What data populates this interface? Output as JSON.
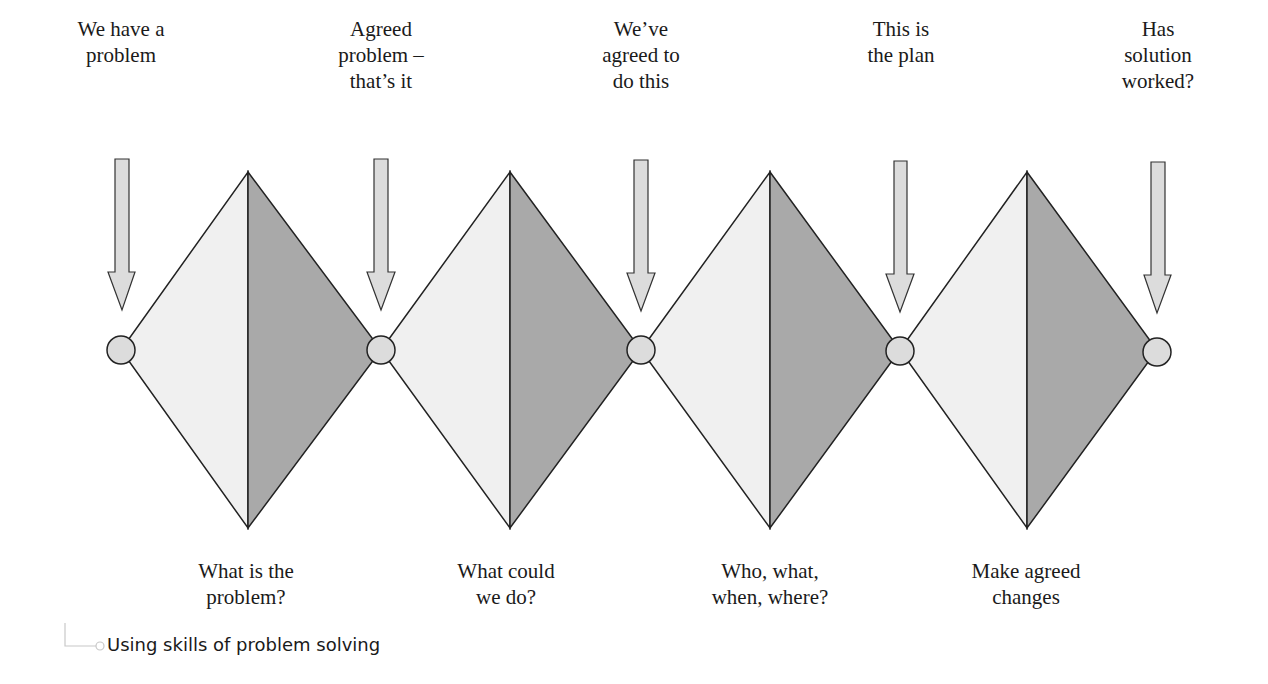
{
  "diagram": {
    "title": "Using skills of problem solving",
    "colors": {
      "light_fill": "#f0f0f0",
      "dark_fill": "#a9a9a9",
      "arrow_fill": "#dcdcdc",
      "node_fill": "#dcdcdc",
      "stroke": "#222222",
      "connector": "#c8c8c8"
    },
    "checkpoints": [
      {
        "label": "We have a\nproblem"
      },
      {
        "label": "Agreed\nproblem –\nthat’s it"
      },
      {
        "label": "We’ve\nagreed to\ndo this"
      },
      {
        "label": "This is\nthe plan"
      },
      {
        "label": "Has\nsolution\nworked?"
      }
    ],
    "stages": [
      {
        "label": "What is the\nproblem?"
      },
      {
        "label": "What could\nwe do?"
      },
      {
        "label": "Who, what,\nwhen, where?"
      },
      {
        "label": "Make agreed\nchanges"
      }
    ]
  }
}
